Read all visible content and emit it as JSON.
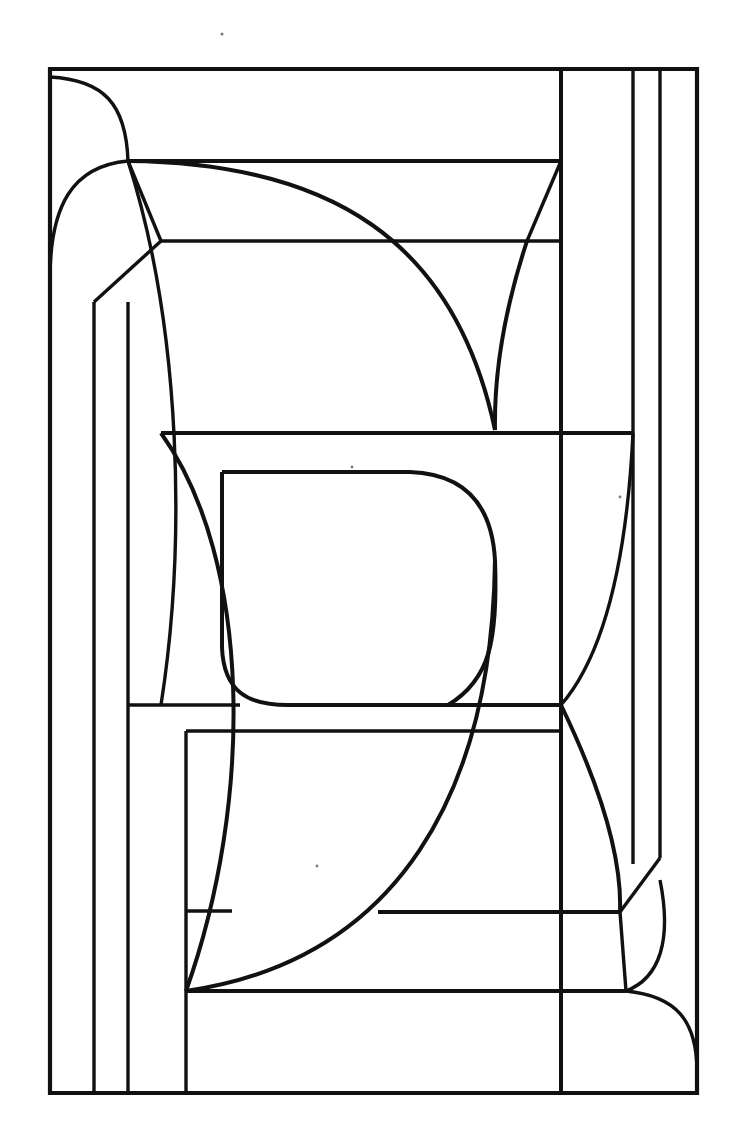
{
  "artwork": {
    "title": "Abstract stained-glass style line drawing",
    "description": "Black ink line art on white: a tall rectangular panel subdivided by straight segments and sweeping arcs into irregular leaded-glass cells",
    "medium": "line-art",
    "canvas": {
      "width": 747,
      "height": 1128,
      "background": "#ffffff"
    },
    "ink_color": "#111111",
    "frame": {
      "left": 50,
      "top": 69,
      "right": 697,
      "bottom": 1093
    },
    "specks": [
      {
        "name": "speck-top",
        "x": 222,
        "y": 34,
        "r": 1.6
      },
      {
        "name": "speck-upper-mid",
        "x": 352,
        "y": 467,
        "r": 1.4
      },
      {
        "name": "speck-right-mid",
        "x": 620,
        "y": 497,
        "r": 1.4
      },
      {
        "name": "speck-lower-left",
        "x": 317,
        "y": 866,
        "r": 1.4
      }
    ],
    "paths": {
      "outer_frame": "M50,69 L697,69 L697,1093 L50,1093 Z",
      "right_strip_1": "M561,69 L561,1093",
      "right_strip_2": "M633,69 L633,858",
      "right_strip_3": "M660,69 L660,858",
      "left_strip_1": "M94,302 L94,1093",
      "left_strip_2": "M128,302 L128,1093",
      "left_strip_3": "M186,911 L186,1093",
      "h_top_band": "M128,161 L561,161",
      "h_sub_240": "M161,241 L527,241",
      "h_240_right": "M527,241 L561,241",
      "h_433": "M161,433 L633,433",
      "h_472": "M222,472 L449,472",
      "h_705": "M128,705 L561,705",
      "h_911": "M186,911 L233,911",
      "h_912_right": "M380,912 L620,912",
      "h_991": "M186,991 L625,991",
      "v_186_top": "M186,731 L186,911",
      "h_731": "M186,731 L561,731",
      "arc_tl_upper": "M50,77 Q120,80 128,161",
      "arc_tl_lower": "M128,161 Q52,170 50,278",
      "diag_tl_a": "M128,161 L161,241",
      "diag_tl_b": "M161,241 L94,302",
      "curve_big_left": "M128,161 Q200,430 161,705",
      "curve_center_spine": "M161,161 Q300,560 186,991",
      "curve_top_sweep": "M128,161 Q430,163 493,433",
      "diag_561_to_527": "M561,161 L527,241",
      "curve_527_down": "M527,241 Q499,330 493,433",
      "curve_z_upper": "M222,472 Q449,472 493,560",
      "curve_z_lower": "M493,560 Q499,650 449,705",
      "curve_z_left": "M222,472 L222,655",
      "curve_z_bottom": "M222,655 Q235,705 290,705",
      "h_z_bottom": "M290,705 L561,705",
      "arc_right_lobe": "M633,433 Q600,640 561,705",
      "curve_bottom_right_spine": "M561,705 Q625,860 620,912",
      "diag_corner_br": "M660,858 L620,912",
      "arc_br_lobe": "M660,885 Q668,965 625,991",
      "v_620_912": "M620,912 L625,991",
      "arc_bottom_right": "M625,991 Q697,1000 697,1070",
      "curve_bottom_sweep": "M493,560 Q470,900 186,991",
      "diag_186_911": "M186,911 L233,911",
      "curve_to_991": "M186,991 L625,991"
    }
  }
}
